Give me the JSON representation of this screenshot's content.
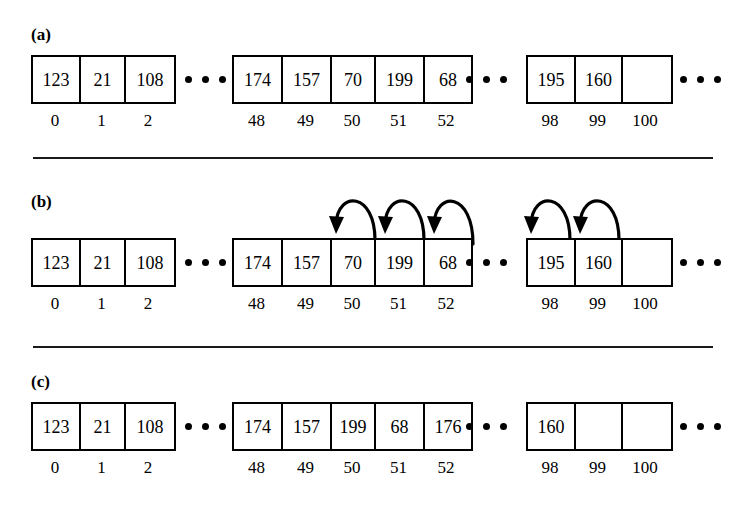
{
  "figure": {
    "caption_labels": [
      "(a)",
      "(b)",
      "(c)"
    ],
    "ellipsis_glyph": "• • •"
  },
  "panels": [
    {
      "id": "panel-a",
      "label": "(a)",
      "groups": [
        {
          "id": "group-a-left",
          "values": [
            "123",
            "21",
            "108"
          ],
          "indices": [
            "0",
            "1",
            "2"
          ]
        },
        {
          "id": "group-a-middle",
          "values": [
            "174",
            "157",
            "70",
            "199",
            "68"
          ],
          "indices": [
            "48",
            "49",
            "50",
            "51",
            "52"
          ]
        },
        {
          "id": "group-a-right",
          "values": [
            "195",
            "160",
            ""
          ],
          "indices": [
            "98",
            "99",
            "100"
          ]
        }
      ],
      "arrows": []
    },
    {
      "id": "panel-b",
      "label": "(b)",
      "groups": [
        {
          "id": "group-b-left",
          "values": [
            "123",
            "21",
            "108"
          ],
          "indices": [
            "0",
            "1",
            "2"
          ]
        },
        {
          "id": "group-b-middle",
          "values": [
            "174",
            "157",
            "70",
            "199",
            "68"
          ],
          "indices": [
            "48",
            "49",
            "50",
            "51",
            "52"
          ]
        },
        {
          "id": "group-b-right",
          "values": [
            "195",
            "160",
            ""
          ],
          "indices": [
            "98",
            "99",
            "100"
          ]
        }
      ],
      "arrows": [
        {
          "from_index": "51",
          "to_index": "50"
        },
        {
          "from_index": "52",
          "to_index": "51"
        },
        {
          "from_index": "53",
          "to_index": "52"
        },
        {
          "from_index": "99",
          "to_index": "98"
        },
        {
          "from_index": "100",
          "to_index": "99"
        }
      ]
    },
    {
      "id": "panel-c",
      "label": "(c)",
      "groups": [
        {
          "id": "group-c-left",
          "values": [
            "123",
            "21",
            "108"
          ],
          "indices": [
            "0",
            "1",
            "2"
          ]
        },
        {
          "id": "group-c-middle",
          "values": [
            "174",
            "157",
            "199",
            "68",
            "176"
          ],
          "indices": [
            "48",
            "49",
            "50",
            "51",
            "52"
          ]
        },
        {
          "id": "group-c-right",
          "values": [
            "160",
            "",
            ""
          ],
          "indices": [
            "98",
            "99",
            "100"
          ]
        }
      ],
      "arrows": []
    }
  ],
  "colors": {
    "ink": "#000000",
    "background": "#ffffff",
    "rule": "#1a1a1a"
  }
}
